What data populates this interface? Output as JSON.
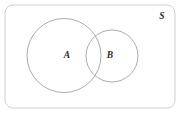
{
  "figure": {
    "type": "venn-diagram",
    "background_color": "#ffffff",
    "universe": {
      "label": "S",
      "label_x": 162,
      "label_y": 17,
      "shape": "rounded-rectangle",
      "x": 5,
      "y": 5,
      "width": 170,
      "height": 103,
      "corner_radius": 8,
      "stroke_color": "#cfcfcf",
      "stroke_width": 1,
      "fill_color": "#ffffff"
    },
    "sets": [
      {
        "label": "A",
        "shape": "circle",
        "cx": 64,
        "cy": 55.5,
        "r": 37,
        "label_x": 67,
        "label_y": 56,
        "stroke_color": "#ababab",
        "stroke_width": 1,
        "fill_color": "none"
      },
      {
        "label": "B",
        "shape": "circle",
        "cx": 112,
        "cy": 56,
        "r": 26,
        "label_x": 110,
        "label_y": 56,
        "stroke_color": "#ababab",
        "stroke_width": 1,
        "fill_color": "none"
      }
    ]
  }
}
